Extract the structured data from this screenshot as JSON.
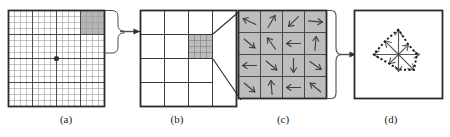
{
  "figure": {
    "background_color": "#ffffff",
    "stroke_color": "#2b2b2b",
    "shade_color": "#b5b5b5",
    "cell_shade_color": "#bcbcbc",
    "fine_grid_color": "#8a8a8a",
    "arrow_color": "#4a4a4a"
  },
  "panels": [
    {
      "id": "a",
      "label": "(a)",
      "type": "image-pixel-grid",
      "grid_cols": 16,
      "grid_rows": 16,
      "block_divisions": 4,
      "keypoint_marker": "center-dot",
      "highlight": {
        "row_start": 0,
        "col_start": 12,
        "rows": 4,
        "cols": 4,
        "position": "top-right"
      }
    },
    {
      "id": "b",
      "label": "(b)",
      "type": "cell-grid",
      "grid_cols": 4,
      "grid_rows": 4,
      "highlight": {
        "row": 1,
        "col": 3,
        "subgrid_cols": 4,
        "subgrid_rows": 4
      }
    },
    {
      "id": "c",
      "label": "(c)",
      "type": "gradient-cell",
      "grid_cols": 4,
      "grid_rows": 4,
      "arrow_angles_deg": [
        [
          205,
          300,
          135,
          5
        ],
        [
          40,
          235,
          180,
          275
        ],
        [
          180,
          40,
          90,
          35
        ],
        [
          40,
          265,
          180,
          220
        ]
      ]
    },
    {
      "id": "d",
      "label": "(d)",
      "type": "orientation-histogram",
      "bins": 8,
      "bin_angles_deg": [
        0,
        45,
        90,
        135,
        180,
        225,
        270,
        315
      ],
      "bin_magnitudes": [
        0.95,
        0.62,
        1.0,
        0.78,
        1.0,
        0.55,
        0.72,
        0.88
      ],
      "envelope": "dotted-polygon"
    }
  ],
  "connectors": [
    {
      "id": "a-to-b",
      "from": "a",
      "to": "b",
      "style": "bracket-arrow"
    },
    {
      "id": "b-to-c",
      "from": "b",
      "to": "c",
      "style": "expansion-lines"
    },
    {
      "id": "c-to-d",
      "from": "c",
      "to": "d",
      "style": "brace-arrow"
    }
  ]
}
